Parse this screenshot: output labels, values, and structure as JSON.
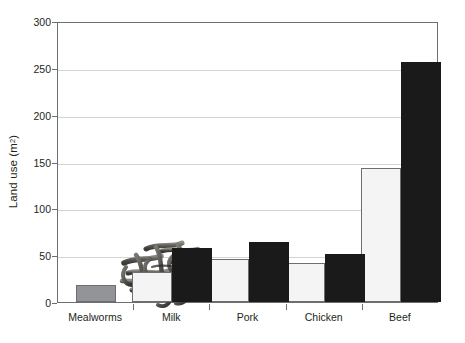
{
  "chart_data": {
    "type": "bar",
    "title": "",
    "subtitle": "",
    "xlabel": "",
    "ylabel": "Land use (m2)",
    "ylabel_display": "Land use (m",
    "ylabel_sup": "2",
    "ylabel_tail": ")",
    "categories": [
      "Mealworms",
      "Milk",
      "Pork",
      "Chicken",
      "Beef"
    ],
    "series": [
      {
        "name": "low-estimate",
        "style": "white",
        "values": [
          null,
          32,
          46,
          42,
          143
        ]
      },
      {
        "name": "high-estimate",
        "style": "black",
        "values": [
          null,
          58,
          64,
          51,
          256
        ]
      },
      {
        "name": "mealworms",
        "style": "gray",
        "values": [
          18,
          null,
          null,
          null,
          null
        ]
      }
    ],
    "ylim": [
      0,
      300
    ],
    "ytick_values": [
      0,
      50,
      100,
      150,
      200,
      250,
      300
    ],
    "ytick_labels": [
      "0",
      "50",
      "100",
      "150",
      "200",
      "250",
      "300"
    ],
    "grid": true,
    "grid_axis": "y",
    "legend": "none",
    "annotation_image": "mealworm-larvae-photo",
    "colors": {
      "bar_white": "#f4f4f4",
      "bar_black": "#1a1a1a",
      "bar_gray": "#929497",
      "axis": "#6d6e71",
      "gridline": "#d4d4d6",
      "text": "#231f20",
      "background": "#ffffff"
    }
  }
}
